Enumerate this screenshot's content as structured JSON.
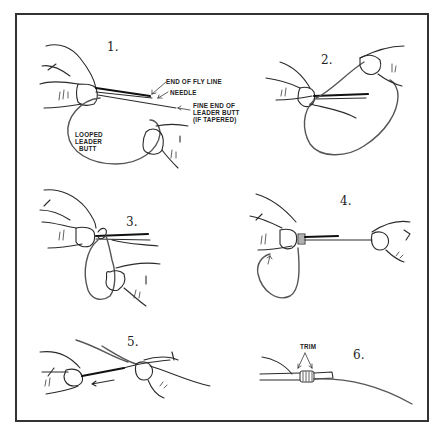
{
  "figure": {
    "border_color": "#333333"
  },
  "panels": [
    {
      "step": "1.",
      "labels": {
        "end_of_fly_line": "END OF FLY LINE",
        "needle": "NEEDLE",
        "fine_end_1": "FINE END OF",
        "fine_end_2": "LEADER BUTT",
        "fine_end_3": "(IF TAPERED)",
        "looped_1": "LOOPED",
        "looped_2": "LEADER",
        "looped_3": "BUTT"
      }
    },
    {
      "step": "2."
    },
    {
      "step": "3."
    },
    {
      "step": "4."
    },
    {
      "step": "5."
    },
    {
      "step": "6.",
      "labels": {
        "trim": "TRIM"
      }
    }
  ]
}
